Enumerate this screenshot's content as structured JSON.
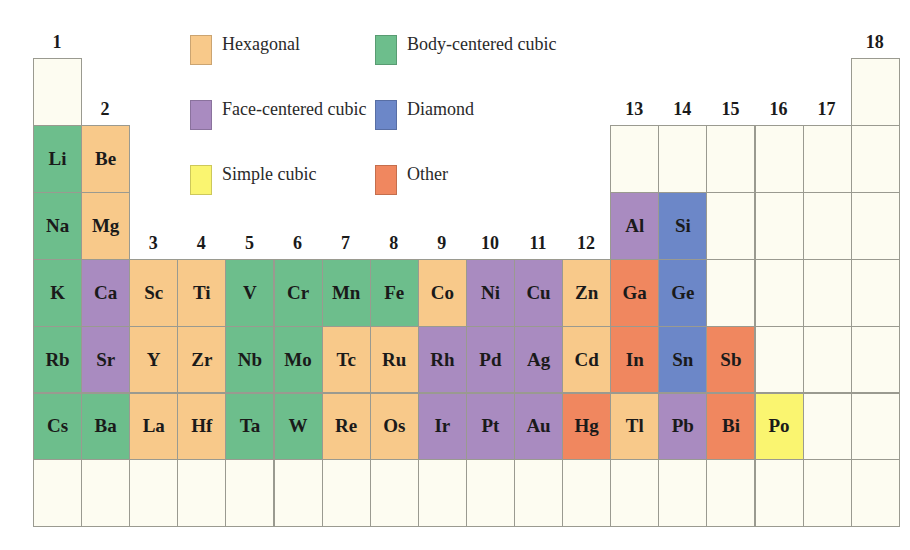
{
  "colors": {
    "hexagonal": "#F8C98A",
    "bcc": "#6DBE8C",
    "fcc": "#A98BC0",
    "diamond": "#6C87C8",
    "simple_cubic": "#FAF570",
    "other": "#F0875F",
    "empty": "#FDFCF1"
  },
  "legend": [
    {
      "key": "hexagonal",
      "label": "Hexagonal",
      "x": 190,
      "y": 35
    },
    {
      "key": "bcc",
      "label": "Body-centered cubic",
      "x": 375,
      "y": 35
    },
    {
      "key": "fcc",
      "label": "Face-centered cubic",
      "x": 190,
      "y": 100
    },
    {
      "key": "diamond",
      "label": "Diamond",
      "x": 375,
      "y": 100
    },
    {
      "key": "simple_cubic",
      "label": "Simple cubic",
      "x": 190,
      "y": 165
    },
    {
      "key": "other",
      "label": "Other",
      "x": 375,
      "y": 165
    }
  ],
  "group_labels": [
    {
      "label": "1",
      "col": 0,
      "row": 0
    },
    {
      "label": "2",
      "col": 1,
      "row": 1
    },
    {
      "label": "3",
      "col": 2,
      "row": 3
    },
    {
      "label": "4",
      "col": 3,
      "row": 3
    },
    {
      "label": "5",
      "col": 4,
      "row": 3
    },
    {
      "label": "6",
      "col": 5,
      "row": 3
    },
    {
      "label": "7",
      "col": 6,
      "row": 3
    },
    {
      "label": "8",
      "col": 7,
      "row": 3
    },
    {
      "label": "9",
      "col": 8,
      "row": 3
    },
    {
      "label": "10",
      "col": 9,
      "row": 3
    },
    {
      "label": "11",
      "col": 10,
      "row": 3
    },
    {
      "label": "12",
      "col": 11,
      "row": 3
    },
    {
      "label": "13",
      "col": 12,
      "row": 1
    },
    {
      "label": "14",
      "col": 13,
      "row": 1
    },
    {
      "label": "15",
      "col": 14,
      "row": 1
    },
    {
      "label": "16",
      "col": 15,
      "row": 1
    },
    {
      "label": "17",
      "col": 16,
      "row": 1
    },
    {
      "label": "18",
      "col": 17,
      "row": 0
    }
  ],
  "grid": {
    "left": 33,
    "top": 58,
    "col_width": 48.1,
    "row_height": 66.9
  },
  "cells": [
    {
      "s": "",
      "c": 0,
      "r": 0,
      "t": "empty"
    },
    {
      "s": "",
      "c": 17,
      "r": 0,
      "t": "empty"
    },
    {
      "s": "Li",
      "c": 0,
      "r": 1,
      "t": "bcc"
    },
    {
      "s": "Be",
      "c": 1,
      "r": 1,
      "t": "hexagonal"
    },
    {
      "s": "",
      "c": 12,
      "r": 1,
      "t": "empty"
    },
    {
      "s": "",
      "c": 13,
      "r": 1,
      "t": "empty"
    },
    {
      "s": "",
      "c": 14,
      "r": 1,
      "t": "empty"
    },
    {
      "s": "",
      "c": 15,
      "r": 1,
      "t": "empty"
    },
    {
      "s": "",
      "c": 16,
      "r": 1,
      "t": "empty"
    },
    {
      "s": "",
      "c": 17,
      "r": 1,
      "t": "empty"
    },
    {
      "s": "Na",
      "c": 0,
      "r": 2,
      "t": "bcc"
    },
    {
      "s": "Mg",
      "c": 1,
      "r": 2,
      "t": "hexagonal"
    },
    {
      "s": "Al",
      "c": 12,
      "r": 2,
      "t": "fcc"
    },
    {
      "s": "Si",
      "c": 13,
      "r": 2,
      "t": "diamond"
    },
    {
      "s": "",
      "c": 14,
      "r": 2,
      "t": "empty"
    },
    {
      "s": "",
      "c": 15,
      "r": 2,
      "t": "empty"
    },
    {
      "s": "",
      "c": 16,
      "r": 2,
      "t": "empty"
    },
    {
      "s": "",
      "c": 17,
      "r": 2,
      "t": "empty"
    },
    {
      "s": "K",
      "c": 0,
      "r": 3,
      "t": "bcc"
    },
    {
      "s": "Ca",
      "c": 1,
      "r": 3,
      "t": "fcc"
    },
    {
      "s": "Sc",
      "c": 2,
      "r": 3,
      "t": "hexagonal"
    },
    {
      "s": "Ti",
      "c": 3,
      "r": 3,
      "t": "hexagonal"
    },
    {
      "s": "V",
      "c": 4,
      "r": 3,
      "t": "bcc"
    },
    {
      "s": "Cr",
      "c": 5,
      "r": 3,
      "t": "bcc"
    },
    {
      "s": "Mn",
      "c": 6,
      "r": 3,
      "t": "bcc"
    },
    {
      "s": "Fe",
      "c": 7,
      "r": 3,
      "t": "bcc"
    },
    {
      "s": "Co",
      "c": 8,
      "r": 3,
      "t": "hexagonal"
    },
    {
      "s": "Ni",
      "c": 9,
      "r": 3,
      "t": "fcc"
    },
    {
      "s": "Cu",
      "c": 10,
      "r": 3,
      "t": "fcc"
    },
    {
      "s": "Zn",
      "c": 11,
      "r": 3,
      "t": "hexagonal"
    },
    {
      "s": "Ga",
      "c": 12,
      "r": 3,
      "t": "other"
    },
    {
      "s": "Ge",
      "c": 13,
      "r": 3,
      "t": "diamond"
    },
    {
      "s": "",
      "c": 14,
      "r": 3,
      "t": "empty"
    },
    {
      "s": "",
      "c": 15,
      "r": 3,
      "t": "empty"
    },
    {
      "s": "",
      "c": 16,
      "r": 3,
      "t": "empty"
    },
    {
      "s": "",
      "c": 17,
      "r": 3,
      "t": "empty"
    },
    {
      "s": "Rb",
      "c": 0,
      "r": 4,
      "t": "bcc"
    },
    {
      "s": "Sr",
      "c": 1,
      "r": 4,
      "t": "fcc"
    },
    {
      "s": "Y",
      "c": 2,
      "r": 4,
      "t": "hexagonal"
    },
    {
      "s": "Zr",
      "c": 3,
      "r": 4,
      "t": "hexagonal"
    },
    {
      "s": "Nb",
      "c": 4,
      "r": 4,
      "t": "bcc"
    },
    {
      "s": "Mo",
      "c": 5,
      "r": 4,
      "t": "bcc"
    },
    {
      "s": "Tc",
      "c": 6,
      "r": 4,
      "t": "hexagonal"
    },
    {
      "s": "Ru",
      "c": 7,
      "r": 4,
      "t": "hexagonal"
    },
    {
      "s": "Rh",
      "c": 8,
      "r": 4,
      "t": "fcc"
    },
    {
      "s": "Pd",
      "c": 9,
      "r": 4,
      "t": "fcc"
    },
    {
      "s": "Ag",
      "c": 10,
      "r": 4,
      "t": "fcc"
    },
    {
      "s": "Cd",
      "c": 11,
      "r": 4,
      "t": "hexagonal"
    },
    {
      "s": "In",
      "c": 12,
      "r": 4,
      "t": "other"
    },
    {
      "s": "Sn",
      "c": 13,
      "r": 4,
      "t": "diamond"
    },
    {
      "s": "Sb",
      "c": 14,
      "r": 4,
      "t": "other"
    },
    {
      "s": "",
      "c": 15,
      "r": 4,
      "t": "empty"
    },
    {
      "s": "",
      "c": 16,
      "r": 4,
      "t": "empty"
    },
    {
      "s": "",
      "c": 17,
      "r": 4,
      "t": "empty"
    },
    {
      "s": "Cs",
      "c": 0,
      "r": 5,
      "t": "bcc"
    },
    {
      "s": "Ba",
      "c": 1,
      "r": 5,
      "t": "bcc"
    },
    {
      "s": "La",
      "c": 2,
      "r": 5,
      "t": "hexagonal"
    },
    {
      "s": "Hf",
      "c": 3,
      "r": 5,
      "t": "hexagonal"
    },
    {
      "s": "Ta",
      "c": 4,
      "r": 5,
      "t": "bcc"
    },
    {
      "s": "W",
      "c": 5,
      "r": 5,
      "t": "bcc"
    },
    {
      "s": "Re",
      "c": 6,
      "r": 5,
      "t": "hexagonal"
    },
    {
      "s": "Os",
      "c": 7,
      "r": 5,
      "t": "hexagonal"
    },
    {
      "s": "Ir",
      "c": 8,
      "r": 5,
      "t": "fcc"
    },
    {
      "s": "Pt",
      "c": 9,
      "r": 5,
      "t": "fcc"
    },
    {
      "s": "Au",
      "c": 10,
      "r": 5,
      "t": "fcc"
    },
    {
      "s": "Hg",
      "c": 11,
      "r": 5,
      "t": "other"
    },
    {
      "s": "Tl",
      "c": 12,
      "r": 5,
      "t": "hexagonal"
    },
    {
      "s": "Pb",
      "c": 13,
      "r": 5,
      "t": "fcc"
    },
    {
      "s": "Bi",
      "c": 14,
      "r": 5,
      "t": "other"
    },
    {
      "s": "Po",
      "c": 15,
      "r": 5,
      "t": "simple_cubic"
    },
    {
      "s": "",
      "c": 16,
      "r": 5,
      "t": "empty"
    },
    {
      "s": "",
      "c": 17,
      "r": 5,
      "t": "empty"
    },
    {
      "s": "",
      "c": 0,
      "r": 6,
      "t": "empty"
    },
    {
      "s": "",
      "c": 1,
      "r": 6,
      "t": "empty"
    },
    {
      "s": "",
      "c": 2,
      "r": 6,
      "t": "empty"
    },
    {
      "s": "",
      "c": 3,
      "r": 6,
      "t": "empty"
    },
    {
      "s": "",
      "c": 4,
      "r": 6,
      "t": "empty"
    },
    {
      "s": "",
      "c": 5,
      "r": 6,
      "t": "empty"
    },
    {
      "s": "",
      "c": 6,
      "r": 6,
      "t": "empty"
    },
    {
      "s": "",
      "c": 7,
      "r": 6,
      "t": "empty"
    },
    {
      "s": "",
      "c": 8,
      "r": 6,
      "t": "empty"
    },
    {
      "s": "",
      "c": 9,
      "r": 6,
      "t": "empty"
    },
    {
      "s": "",
      "c": 10,
      "r": 6,
      "t": "empty"
    },
    {
      "s": "",
      "c": 11,
      "r": 6,
      "t": "empty"
    },
    {
      "s": "",
      "c": 12,
      "r": 6,
      "t": "empty"
    },
    {
      "s": "",
      "c": 13,
      "r": 6,
      "t": "empty"
    },
    {
      "s": "",
      "c": 14,
      "r": 6,
      "t": "empty"
    },
    {
      "s": "",
      "c": 15,
      "r": 6,
      "t": "empty"
    },
    {
      "s": "",
      "c": 16,
      "r": 6,
      "t": "empty"
    },
    {
      "s": "",
      "c": 17,
      "r": 6,
      "t": "empty"
    }
  ]
}
